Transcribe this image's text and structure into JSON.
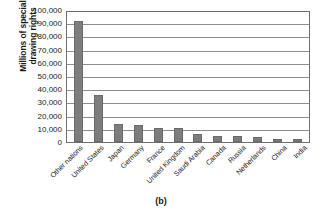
{
  "caption": "(b)",
  "chart_data": {
    "type": "bar",
    "title": "",
    "subtitle": "",
    "xlabel": "",
    "ylabel": "Millions of special drawing rights",
    "ylabel_lines": [
      "Millions of special",
      "drawing rights"
    ],
    "categories": [
      "Other nations",
      "United States",
      "Japan",
      "Germany",
      "France",
      "United Kingdom",
      "Saudi Arabia",
      "Canada",
      "Russia",
      "Netherlands",
      "China",
      "India"
    ],
    "values": [
      93000,
      36000,
      13500,
      13000,
      10500,
      10500,
      6000,
      4500,
      4500,
      3500,
      2500,
      2000
    ],
    "ylim": [
      0,
      100000
    ],
    "ytick_labels": [
      "100,000",
      "90,000",
      "80,000",
      "70,000",
      "60,000",
      "50,000",
      "40,000",
      "30,000",
      "20,000",
      "10,000",
      "0"
    ],
    "ytick_values": [
      100000,
      90000,
      80000,
      70000,
      60000,
      50000,
      40000,
      30000,
      20000,
      10000,
      0
    ],
    "grid": true,
    "grid_axis": "y",
    "legend": false,
    "legend_position": "none",
    "bar_color": "#7d7d7d",
    "bar_edge_color": "#6a6a6a",
    "plot_border_color": "#6e6e6e",
    "grid_color": "#8d8d8d",
    "background_color": "#ffffff",
    "text_color": "#1a1a1a"
  }
}
